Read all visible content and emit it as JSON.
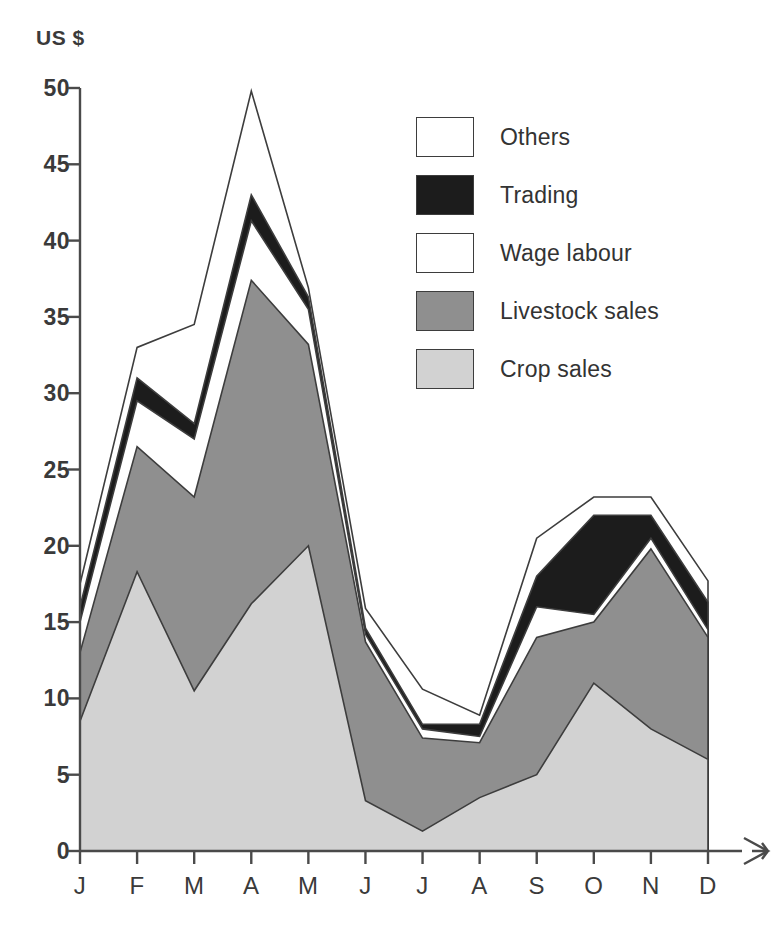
{
  "chart_data": {
    "type": "area",
    "stacked": true,
    "title": "",
    "subtitle": "",
    "xlabel": "",
    "ylabel": "US $",
    "y_unit_label": "US $",
    "categories": [
      "J",
      "F",
      "M",
      "A",
      "M",
      "J",
      "J",
      "A",
      "S",
      "O",
      "N",
      "D"
    ],
    "category_full_names": [
      "January",
      "February",
      "March",
      "April",
      "May",
      "June",
      "July",
      "August",
      "September",
      "October",
      "November",
      "December"
    ],
    "ylim": [
      0,
      50
    ],
    "yticks": [
      0,
      5,
      10,
      15,
      20,
      25,
      30,
      35,
      40,
      45,
      50
    ],
    "ytick_labels": [
      "0",
      "5",
      "10",
      "15",
      "20",
      "25",
      "30",
      "35",
      "40",
      "45",
      "50"
    ],
    "grid": false,
    "legend_position": "upper-right-inside",
    "x_axis_arrow": true,
    "series": [
      {
        "name": "Crop sales",
        "color": "#d2d2d2",
        "order": 1,
        "values": [
          8.5,
          18.3,
          10.5,
          16.2,
          20.0,
          3.3,
          1.3,
          3.5,
          5.0,
          11.0,
          8.0,
          6.0
        ]
      },
      {
        "name": "Livestock sales",
        "color": "#8f8f8f",
        "order": 2,
        "values": [
          4.5,
          8.2,
          12.7,
          21.2,
          13.2,
          10.4,
          6.1,
          3.6,
          9.0,
          4.0,
          11.8,
          8.0
        ]
      },
      {
        "name": "Wage labour",
        "color": "#ffffff",
        "order": 3,
        "values": [
          2.0,
          3.0,
          3.8,
          3.9,
          2.3,
          0.5,
          0.6,
          0.4,
          2.0,
          0.5,
          0.7,
          0.5
        ]
      },
      {
        "name": "Trading",
        "color": "#1c1c1c",
        "order": 4,
        "values": [
          1.0,
          1.5,
          1.0,
          1.7,
          0.8,
          0.4,
          0.3,
          0.8,
          2.0,
          6.5,
          1.5,
          1.8
        ]
      },
      {
        "name": "Others",
        "color": "#ffffff",
        "order": 5,
        "values": [
          1.5,
          2.0,
          6.5,
          6.8,
          0.6,
          1.3,
          2.3,
          0.6,
          2.5,
          1.2,
          1.2,
          1.4
        ]
      }
    ],
    "cumulative_tops": {
      "Crop sales": [
        8.5,
        18.3,
        10.5,
        16.2,
        20.0,
        3.3,
        1.3,
        3.5,
        5.0,
        11.0,
        8.0,
        6.0
      ],
      "Livestock sales": [
        13.0,
        26.5,
        23.2,
        37.4,
        33.2,
        13.7,
        7.4,
        7.1,
        14.0,
        15.0,
        19.8,
        14.0
      ],
      "Wage labour": [
        15.0,
        29.5,
        27.0,
        41.3,
        35.5,
        14.2,
        8.0,
        7.5,
        16.0,
        15.5,
        20.5,
        14.5
      ],
      "Trading": [
        16.0,
        31.0,
        28.0,
        43.0,
        36.3,
        14.6,
        8.3,
        8.3,
        18.0,
        22.0,
        22.0,
        16.3
      ],
      "Others": [
        17.5,
        33.0,
        34.5,
        49.8,
        36.9,
        15.9,
        10.6,
        8.9,
        20.5,
        23.2,
        23.2,
        17.7
      ]
    }
  },
  "legend": {
    "items": [
      {
        "label": "Others",
        "swatch": "#ffffff"
      },
      {
        "label": "Trading",
        "swatch": "#1c1c1c"
      },
      {
        "label": "Wage labour",
        "swatch": "#ffffff"
      },
      {
        "label": "Livestock sales",
        "swatch": "#8f8f8f"
      },
      {
        "label": "Crop sales",
        "swatch": "#d2d2d2"
      }
    ]
  },
  "axes": {
    "y_unit": "US $",
    "arrow_glyph": "⇥"
  },
  "colors": {
    "crop_sales": "#d2d2d2",
    "livestock_sales": "#8f8f8f",
    "wage_labour": "#ffffff",
    "trading": "#1c1c1c",
    "others": "#ffffff",
    "axis": "#4a4a4a",
    "outline": "#3d3d3d",
    "text": "#333333"
  }
}
